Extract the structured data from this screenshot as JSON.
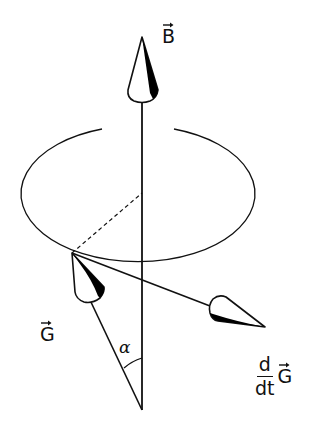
{
  "figure": {
    "type": "precession-diagram",
    "labels": {
      "field_vector": "B",
      "angular_momentum_vector": "G",
      "angle": "α",
      "derivative_numerator": "d",
      "derivative_denominator": "dt",
      "derivative_vector": "G"
    },
    "colors": {
      "stroke": "#111111",
      "fill_shade": "#000000",
      "background": "#ffffff"
    },
    "geometry": {
      "axis": {
        "x": 142,
        "y_top": 100,
        "y_bottom": 410
      },
      "precession_ellipse": {
        "cx": 142,
        "cy": 193,
        "rx": 117,
        "ry": 68
      },
      "g_vector": {
        "from": [
          142,
          410
        ],
        "to": [
          72,
          253
        ]
      },
      "dgdt_vector": {
        "from": [
          72,
          253
        ],
        "to": [
          265,
          328
        ]
      },
      "radius_dashed": {
        "from": [
          72,
          253
        ],
        "to": [
          142,
          193
        ]
      }
    }
  }
}
